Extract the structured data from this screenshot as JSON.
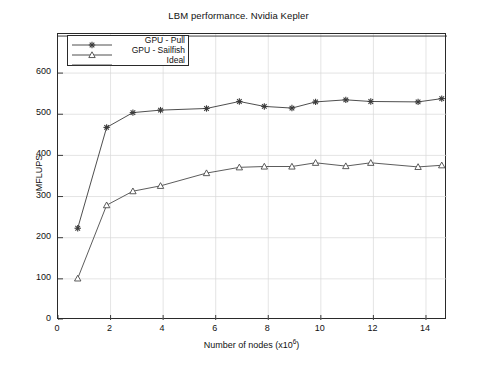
{
  "chart_data": {
    "type": "line",
    "title": "LBM performance. Nvidia Kepler",
    "xlabel": "Number of nodes (x10⁶)",
    "xlabel_base": "Number of nodes (x10",
    "xlabel_exp": "6",
    "xlabel_tail": ")",
    "ylabel": "MFLUPS",
    "xlim": [
      0,
      14.8
    ],
    "ylim": [
      0,
      695
    ],
    "xticks": [
      0,
      2,
      4,
      6,
      8,
      10,
      12,
      14
    ],
    "yticks": [
      0,
      100,
      200,
      300,
      400,
      500,
      600
    ],
    "grid": true,
    "legend_position": "upper left",
    "series": [
      {
        "name": "GPU - Pull",
        "marker": "star",
        "color": "#3a3a3a",
        "x": [
          0.75,
          1.85,
          2.85,
          3.9,
          5.65,
          6.9,
          7.85,
          8.9,
          9.8,
          10.95,
          11.9,
          13.7,
          14.6
        ],
        "y": [
          223,
          468,
          504,
          510,
          514,
          531,
          519,
          515,
          530,
          535,
          531,
          530,
          538
        ]
      },
      {
        "name": "GPU - Sailfish",
        "marker": "triangle",
        "color": "#4a4a4a",
        "x": [
          0.75,
          1.85,
          2.85,
          3.9,
          5.65,
          6.9,
          7.85,
          8.9,
          9.8,
          10.95,
          11.9,
          13.7,
          14.6
        ],
        "y": [
          101,
          279,
          313,
          326,
          357,
          371,
          373,
          373,
          382,
          374,
          382,
          372,
          376
        ]
      },
      {
        "name": "Ideal",
        "marker": "none",
        "color": "#2a2a2a",
        "x": [
          0,
          14.8
        ],
        "y": [
          690,
          690
        ]
      }
    ]
  },
  "legend": {
    "items": [
      {
        "label": "GPU - Pull",
        "marker": "star"
      },
      {
        "label": "GPU - Sailfish",
        "marker": "triangle"
      },
      {
        "label": "Ideal",
        "marker": "line"
      }
    ]
  }
}
